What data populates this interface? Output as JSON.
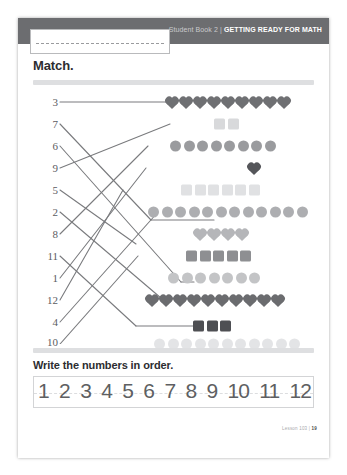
{
  "header": {
    "book_label": "Student Book 2",
    "separator": "|",
    "section_title": "GETTING READY FOR MATH"
  },
  "name_box": {
    "value": "",
    "placeholder": ""
  },
  "match_section": {
    "title": "Match.",
    "numbers": [
      "3",
      "7",
      "6",
      "9",
      "5",
      "2",
      "8",
      "11",
      "1",
      "12",
      "4",
      "10"
    ],
    "shape_rows": [
      {
        "shape": "heart",
        "count": 9,
        "color": "#6f7073",
        "size": 11
      },
      {
        "shape": "square",
        "count": 2,
        "color": "#d8d9db",
        "size": 11
      },
      {
        "shape": "circle",
        "count": 8,
        "color": "#9a9b9e",
        "size": 11
      },
      {
        "shape": "heart",
        "count": 1,
        "color": "#55565a",
        "size": 11
      },
      {
        "shape": "square",
        "count": 6,
        "color": "#e0e1e3",
        "size": 11
      },
      {
        "shape": "circle",
        "count": 12,
        "color": "#adaeb1",
        "size": 11
      },
      {
        "shape": "heart",
        "count": 4,
        "color": "#b5b6b9",
        "size": 11
      },
      {
        "shape": "square",
        "count": 5,
        "color": "#8e8f92",
        "size": 11
      },
      {
        "shape": "circle",
        "count": 7,
        "color": "#c3c4c6",
        "size": 11
      },
      {
        "shape": "heart",
        "count": 10,
        "color": "#6b6c6f",
        "size": 11
      },
      {
        "shape": "square",
        "count": 3,
        "color": "#4e4f53",
        "size": 11
      },
      {
        "shape": "circle",
        "count": 11,
        "color": "#e3e4e6",
        "size": 11
      }
    ]
  },
  "write_section": {
    "title": "Write the numbers in order.",
    "numbers": [
      "1",
      "2",
      "3",
      "4",
      "5",
      "6",
      "7",
      "8",
      "9",
      "10",
      "11",
      "12"
    ]
  },
  "footer": {
    "lesson_label": "Lesson 103",
    "separator": "|",
    "page_number": "19"
  },
  "colors": {
    "header_band": "#6c6d70",
    "divider": "#dedfe1",
    "line_stroke": "#7a7b7e",
    "text_dark": "#2c2d30",
    "number_label": "#5b5c5f"
  }
}
